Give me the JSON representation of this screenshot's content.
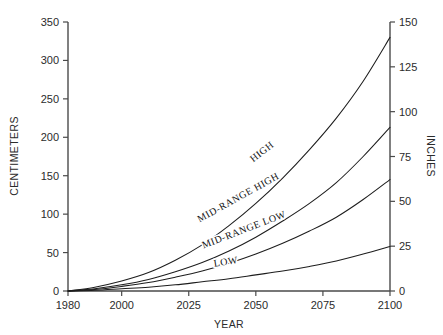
{
  "chart_data": {
    "type": "line",
    "title": "",
    "xlabel": "YEAR",
    "ylabel": "CENTIMETERS",
    "y2label": "INCHES",
    "xlim": [
      1980,
      2100
    ],
    "ylim": [
      0,
      350
    ],
    "y2lim": [
      0,
      150
    ],
    "grid": false,
    "legend": "inline-curve-labels",
    "xticks": [
      1980,
      2000,
      2025,
      2050,
      2075,
      2100
    ],
    "xtick_labels": [
      "1980",
      "2000",
      "2025",
      "2050",
      "2075",
      "2100"
    ],
    "yticks": [
      0,
      50,
      100,
      150,
      200,
      250,
      300,
      350
    ],
    "ytick_labels": [
      "0",
      "50",
      "100",
      "150",
      "200",
      "250",
      "300",
      "350"
    ],
    "y2ticks": [
      0,
      25,
      50,
      75,
      100,
      125,
      150
    ],
    "y2tick_labels": [
      "0",
      "25",
      "50",
      "75",
      "100",
      "125",
      "150"
    ],
    "x": [
      1980,
      1990,
      2000,
      2010,
      2020,
      2030,
      2040,
      2050,
      2060,
      2070,
      2080,
      2090,
      2100
    ],
    "series": [
      {
        "name": "HIGH",
        "label": "HIGH",
        "label_x": 2053,
        "label_y_cm": 178,
        "label_rotation": -38,
        "values": [
          0,
          5,
          13,
          24,
          40,
          60,
          85,
          114,
          147,
          184,
          225,
          273,
          330
        ]
      },
      {
        "name": "MID-RANGE HIGH",
        "label": "MID-RANGE HIGH",
        "label_x": 2044,
        "label_y_cm": 118,
        "label_rotation": -29,
        "values": [
          0,
          3,
          8,
          15,
          25,
          37,
          52,
          70,
          91,
          114,
          141,
          175,
          213
        ]
      },
      {
        "name": "MID-RANGE LOW",
        "label": "MID-RANGE LOW",
        "label_x": 2046,
        "label_y_cm": 76,
        "label_rotation": -21,
        "values": [
          0,
          2,
          6,
          11,
          18,
          26,
          36,
          48,
          62,
          78,
          96,
          119,
          145
        ]
      },
      {
        "name": "LOW",
        "label": "LOW",
        "label_x": 2039,
        "label_y_cm": 34,
        "label_rotation": -9,
        "values": [
          0,
          1,
          3,
          5,
          8,
          12,
          16,
          21,
          26,
          32,
          39,
          48,
          58
        ]
      }
    ],
    "colors": {
      "curve": "#1d1d1d",
      "axis": "#4a4a4a",
      "text": "#2b2b2b",
      "background": "#ffffff"
    }
  }
}
